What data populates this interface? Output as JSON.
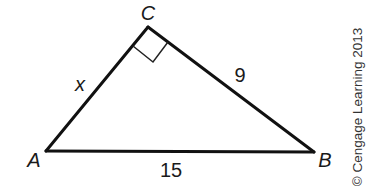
{
  "figure": {
    "type": "right-triangle",
    "stroke_color": "#111111",
    "vertices": {
      "A": {
        "label": "A",
        "x": 46,
        "y": 151
      },
      "B": {
        "label": "B",
        "x": 314,
        "y": 152
      },
      "C": {
        "label": "C",
        "x": 148,
        "y": 27
      }
    },
    "right_angle_at": "C",
    "sides": {
      "AC": {
        "label": "x"
      },
      "CB": {
        "label": "9"
      },
      "AB": {
        "label": "15"
      }
    },
    "copyright": "© Cengage Learning 2013"
  }
}
